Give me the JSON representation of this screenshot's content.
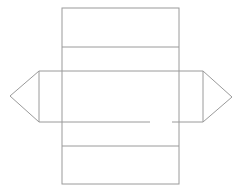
{
  "diagram": {
    "type": "net",
    "canvas": {
      "width": 246,
      "height": 196,
      "background": "#ffffff"
    },
    "line_color": "#9a9a9a",
    "faces": {
      "rect_top": {
        "x": 62,
        "y": 8,
        "w": 117,
        "h": 39
      },
      "rect_upper_middle": {
        "x": 62,
        "y": 47,
        "w": 117,
        "h": 24
      },
      "rect_overlap_band": {
        "x": 39,
        "y": 71,
        "w": 164,
        "h": 51
      },
      "rect_lower_middle": {
        "x": 62,
        "y": 122,
        "w": 117,
        "h": 24
      },
      "rect_bottom": {
        "x": 62,
        "y": 146,
        "w": 117,
        "h": 38
      },
      "triangle_left": {
        "points": [
          [
            39,
            71
          ],
          [
            10,
            96
          ],
          [
            39,
            122
          ]
        ]
      },
      "triangle_right": {
        "points": [
          [
            203,
            71
          ],
          [
            232,
            97
          ],
          [
            203,
            122
          ]
        ]
      }
    },
    "labels": []
  }
}
